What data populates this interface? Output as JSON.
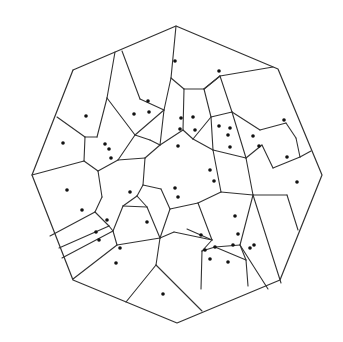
{
  "diagram": {
    "type": "voronoi",
    "colors": {
      "background": "#ffffff",
      "edge": "#333333",
      "site": "#111111"
    },
    "boundary": [
      [
        73,
        70
      ],
      [
        176,
        26
      ],
      [
        278,
        69
      ],
      [
        322,
        175
      ],
      [
        280,
        280
      ],
      [
        177,
        323
      ],
      [
        73,
        280
      ],
      [
        32,
        175
      ]
    ],
    "edges": [
      [
        [
          115,
          52
        ],
        [
          107,
          98
        ]
      ],
      [
        [
          122,
          51
        ],
        [
          140,
          99
        ]
      ],
      [
        [
          107,
          98
        ],
        [
          97,
          137
        ]
      ],
      [
        [
          107,
          98
        ],
        [
          135,
          135
        ]
      ],
      [
        [
          140,
          99
        ],
        [
          164,
          110
        ]
      ],
      [
        [
          164,
          110
        ],
        [
          135,
          135
        ]
      ],
      [
        [
          164,
          110
        ],
        [
          160,
          145
        ]
      ],
      [
        [
          176,
          26
        ],
        [
          171,
          78
        ]
      ],
      [
        [
          171,
          78
        ],
        [
          164,
          110
        ]
      ],
      [
        [
          171,
          78
        ],
        [
          184,
          89
        ]
      ],
      [
        [
          184,
          89
        ],
        [
          204,
          89
        ]
      ],
      [
        [
          204,
          89
        ],
        [
          220,
          76
        ]
      ],
      [
        [
          220,
          76
        ],
        [
          273,
          67
        ]
      ],
      [
        [
          220,
          76
        ],
        [
          232,
          112
        ]
      ],
      [
        [
          232,
          112
        ],
        [
          260,
          130
        ]
      ],
      [
        [
          260,
          130
        ],
        [
          286,
          123
        ]
      ],
      [
        [
          286,
          123
        ],
        [
          296,
          138
        ]
      ],
      [
        [
          296,
          138
        ],
        [
          300,
          157
        ]
      ],
      [
        [
          300,
          157
        ],
        [
          311,
          151
        ]
      ],
      [
        [
          300,
          157
        ],
        [
          273,
          168
        ]
      ],
      [
        [
          273,
          168
        ],
        [
          262,
          145
        ]
      ],
      [
        [
          262,
          145
        ],
        [
          246,
          158
        ]
      ],
      [
        [
          246,
          158
        ],
        [
          232,
          112
        ]
      ],
      [
        [
          246,
          158
        ],
        [
          253,
          195
        ]
      ],
      [
        [
          232,
          112
        ],
        [
          211,
          117
        ]
      ],
      [
        [
          211,
          117
        ],
        [
          213,
          150
        ]
      ],
      [
        [
          204,
          89
        ],
        [
          211,
          117
        ]
      ],
      [
        [
          184,
          89
        ],
        [
          183,
          130
        ]
      ],
      [
        [
          183,
          130
        ],
        [
          193,
          139
        ]
      ],
      [
        [
          193,
          139
        ],
        [
          211,
          117
        ]
      ],
      [
        [
          193,
          139
        ],
        [
          213,
          150
        ]
      ],
      [
        [
          183,
          130
        ],
        [
          160,
          145
        ]
      ],
      [
        [
          160,
          145
        ],
        [
          150,
          140
        ]
      ],
      [
        [
          150,
          140
        ],
        [
          135,
          135
        ]
      ],
      [
        [
          73,
          70
        ],
        [
          73,
          70
        ]
      ],
      [
        [
          57,
          117
        ],
        [
          85,
          137
        ]
      ],
      [
        [
          85,
          137
        ],
        [
          97,
          137
        ]
      ],
      [
        [
          85,
          137
        ],
        [
          84,
          161
        ]
      ],
      [
        [
          84,
          161
        ],
        [
          32,
          175
        ]
      ],
      [
        [
          84,
          161
        ],
        [
          98,
          171
        ]
      ],
      [
        [
          98,
          171
        ],
        [
          118,
          160
        ]
      ],
      [
        [
          118,
          160
        ],
        [
          135,
          135
        ]
      ],
      [
        [
          118,
          160
        ],
        [
          145,
          158
        ]
      ],
      [
        [
          145,
          158
        ],
        [
          160,
          145
        ]
      ],
      [
        [
          145,
          158
        ],
        [
          143,
          185
        ]
      ],
      [
        [
          143,
          185
        ],
        [
          137,
          196
        ]
      ],
      [
        [
          137,
          196
        ],
        [
          123,
          206
        ]
      ],
      [
        [
          123,
          206
        ],
        [
          113,
          231
        ]
      ],
      [
        [
          98,
          171
        ],
        [
          102,
          197
        ]
      ],
      [
        [
          102,
          197
        ],
        [
          95,
          212
        ]
      ],
      [
        [
          95,
          212
        ],
        [
          50,
          236
        ]
      ],
      [
        [
          95,
          212
        ],
        [
          109,
          226
        ]
      ],
      [
        [
          109,
          226
        ],
        [
          59,
          248
        ]
      ],
      [
        [
          109,
          226
        ],
        [
          113,
          231
        ]
      ],
      [
        [
          113,
          231
        ],
        [
          62,
          258
        ]
      ],
      [
        [
          113,
          231
        ],
        [
          117,
          245
        ]
      ],
      [
        [
          117,
          245
        ],
        [
          73,
          279
        ]
      ],
      [
        [
          143,
          185
        ],
        [
          161,
          189
        ]
      ],
      [
        [
          161,
          189
        ],
        [
          170,
          209
        ]
      ],
      [
        [
          170,
          209
        ],
        [
          160,
          238
        ]
      ],
      [
        [
          137,
          196
        ],
        [
          147,
          207
        ]
      ],
      [
        [
          147,
          207
        ],
        [
          160,
          238
        ]
      ],
      [
        [
          147,
          207
        ],
        [
          123,
          206
        ]
      ],
      [
        [
          160,
          238
        ],
        [
          117,
          245
        ]
      ],
      [
        [
          160,
          238
        ],
        [
          156,
          265
        ]
      ],
      [
        [
          156,
          265
        ],
        [
          126,
          302
        ]
      ],
      [
        [
          156,
          265
        ],
        [
          202,
          311
        ]
      ],
      [
        [
          160,
          238
        ],
        [
          174,
          232
        ]
      ],
      [
        [
          170,
          209
        ],
        [
          198,
          203
        ]
      ],
      [
        [
          198,
          203
        ],
        [
          221,
          192
        ]
      ],
      [
        [
          221,
          192
        ],
        [
          213,
          150
        ]
      ],
      [
        [
          221,
          192
        ],
        [
          253,
          195
        ]
      ],
      [
        [
          253,
          195
        ],
        [
          287,
          195
        ]
      ],
      [
        [
          287,
          195
        ],
        [
          298,
          230
        ]
      ],
      [
        [
          198,
          203
        ],
        [
          212,
          240
        ]
      ],
      [
        [
          212,
          240
        ],
        [
          202,
          251
        ]
      ],
      [
        [
          174,
          232
        ],
        [
          212,
          240
        ]
      ],
      [
        [
          202,
          251
        ],
        [
          201,
          289
        ]
      ],
      [
        [
          202,
          251
        ],
        [
          215,
          247
        ]
      ],
      [
        [
          215,
          247
        ],
        [
          246,
          260
        ]
      ],
      [
        [
          246,
          260
        ],
        [
          248,
          286
        ]
      ],
      [
        [
          246,
          260
        ],
        [
          240,
          245
        ]
      ],
      [
        [
          240,
          245
        ],
        [
          253,
          195
        ]
      ],
      [
        [
          215,
          247
        ],
        [
          240,
          245
        ]
      ],
      [
        [
          212,
          240
        ],
        [
          187,
          229
        ]
      ],
      [
        [
          240,
          245
        ],
        [
          268,
          289
        ]
      ],
      [
        [
          253,
          195
        ],
        [
          281,
          283
        ]
      ],
      [
        [
          213,
          150
        ],
        [
          246,
          158
        ]
      ],
      [
        [
          204,
          89
        ],
        [
          220,
          76
        ]
      ]
    ],
    "sites": [
      [
        175,
        61
      ],
      [
        219,
        71
      ],
      [
        86,
        116
      ],
      [
        134,
        114
      ],
      [
        148,
        101
      ],
      [
        149,
        112
      ],
      [
        63,
        143
      ],
      [
        105,
        144
      ],
      [
        109,
        149
      ],
      [
        111,
        158
      ],
      [
        181,
        118
      ],
      [
        193,
        117
      ],
      [
        195,
        130
      ],
      [
        180,
        129
      ],
      [
        178,
        146
      ],
      [
        219,
        126
      ],
      [
        230,
        128
      ],
      [
        228,
        135
      ],
      [
        230,
        147
      ],
      [
        284,
        120
      ],
      [
        287,
        157
      ],
      [
        297,
        182
      ],
      [
        253,
        136
      ],
      [
        259,
        146
      ],
      [
        210,
        170
      ],
      [
        214,
        181
      ],
      [
        175,
        188
      ],
      [
        178,
        197
      ],
      [
        130,
        192
      ],
      [
        147,
        222
      ],
      [
        67,
        190
      ],
      [
        82,
        210
      ],
      [
        107,
        220
      ],
      [
        96,
        232
      ],
      [
        99,
        240
      ],
      [
        120,
        248
      ],
      [
        116,
        263
      ],
      [
        163,
        294
      ],
      [
        205,
        250
      ],
      [
        210,
        259
      ],
      [
        215,
        247
      ],
      [
        201,
        235
      ],
      [
        228,
        262
      ],
      [
        235,
        216
      ],
      [
        238,
        234
      ],
      [
        250,
        248
      ],
      [
        254,
        245
      ],
      [
        233,
        245
      ]
    ]
  }
}
